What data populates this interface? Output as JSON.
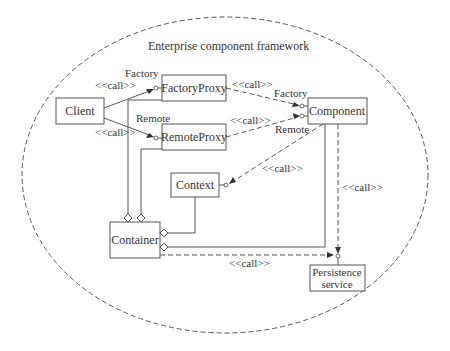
{
  "diagram": {
    "title": "Enterprise component framework",
    "nodes": {
      "client": "Client",
      "factory_proxy": "FactoryProxy",
      "remote_proxy": "RemoteProxy",
      "component": "Component",
      "context": "Context",
      "container": "Container",
      "persistence_line1": "Persistence",
      "persistence_line2": "service"
    },
    "labels": {
      "factory_left": "Factory",
      "remote_left": "Remote",
      "call_client_factory": "<<call>>",
      "call_client_remote": "<<call>>",
      "call_factoryproxy_component": "<<call>>",
      "call_remoteproxy_component": "<<call>>",
      "factory_right": "Factory",
      "remote_right": "Remote",
      "call_component_context": "<<call>>",
      "call_component_persistence": "<<call>>",
      "call_container_persistence": "<<call>>"
    },
    "edges": [
      {
        "from": "Client",
        "to": "FactoryProxy",
        "type": "call",
        "interface": "Factory"
      },
      {
        "from": "Client",
        "to": "RemoteProxy",
        "type": "call",
        "interface": "Remote"
      },
      {
        "from": "FactoryProxy",
        "to": "Component",
        "type": "call",
        "interface": "Factory"
      },
      {
        "from": "RemoteProxy",
        "to": "Component",
        "type": "call",
        "interface": "Remote"
      },
      {
        "from": "Component",
        "to": "Context",
        "type": "call"
      },
      {
        "from": "Component",
        "to": "Persistence service",
        "type": "call"
      },
      {
        "from": "Container",
        "to": "Persistence service",
        "type": "call"
      },
      {
        "from": "Container",
        "to": "FactoryProxy",
        "type": "aggregation"
      },
      {
        "from": "Container",
        "to": "RemoteProxy",
        "type": "aggregation"
      },
      {
        "from": "Container",
        "to": "Context",
        "type": "aggregation"
      },
      {
        "from": "Container",
        "to": "Component",
        "type": "aggregation"
      }
    ]
  }
}
